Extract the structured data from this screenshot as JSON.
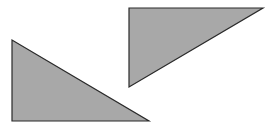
{
  "canvas": {
    "width": 269,
    "height": 125,
    "background": "#ffffff"
  },
  "style": {
    "fill": "#a8a8a8",
    "stroke": "#2a2a2a",
    "stroke_width": 1.2
  },
  "shapes": [
    {
      "name": "triangle-left",
      "type": "right-triangle",
      "right_angle": "bottom-left",
      "points": [
        [
          12,
          40
        ],
        [
          12,
          121
        ],
        [
          149,
          121
        ]
      ]
    },
    {
      "name": "triangle-right",
      "type": "right-triangle",
      "right_angle": "top-left",
      "points": [
        [
          129,
          8
        ],
        [
          263,
          8
        ],
        [
          129,
          87
        ]
      ]
    }
  ]
}
